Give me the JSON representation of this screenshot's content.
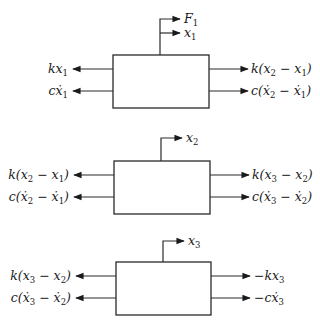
{
  "diagram": {
    "type": "free-body diagrams of three masses (spring-damper system)",
    "colors": {
      "stroke": "#2a2a2a",
      "text": "#1a1a1a",
      "background": "#ffffff"
    },
    "blocks": [
      {
        "id": "mass-1",
        "top_labels": [
          {
            "base": "F",
            "sub": "1",
            "text": "F₁"
          },
          {
            "base": "x",
            "sub": "1",
            "text": "x₁"
          }
        ],
        "left_forces": [
          {
            "text": "kx₁",
            "parts": [
              "kx",
              "1",
              ""
            ]
          },
          {
            "text": "cẋ₁",
            "parts": [
              "cẋ",
              "1",
              ""
            ]
          }
        ],
        "right_forces": [
          {
            "text": "k(x₂ − x₁)",
            "parts": [
              "k(x",
              "2",
              " − x",
              "1",
              ")"
            ]
          },
          {
            "text": "c(ẋ₂ − ẋ₁)",
            "parts": [
              "c(ẋ",
              "2",
              " − ẋ",
              "1",
              ")"
            ]
          }
        ]
      },
      {
        "id": "mass-2",
        "top_labels": [
          {
            "base": "x",
            "sub": "2",
            "text": "x₂"
          }
        ],
        "left_forces": [
          {
            "text": "k(x₂ − x₁)",
            "parts": [
              "k(x",
              "2",
              " − x",
              "1",
              ")"
            ]
          },
          {
            "text": "c(ẋ₂ − ẋ₁)",
            "parts": [
              "c(ẋ",
              "2",
              " − ẋ",
              "1",
              ")"
            ]
          }
        ],
        "right_forces": [
          {
            "text": "k(x₃ − x₂)",
            "parts": [
              "k(x",
              "3",
              " − x",
              "2",
              ")"
            ]
          },
          {
            "text": "c(ẋ₃ − ẋ₂)",
            "parts": [
              "c(ẋ",
              "3",
              " − ẋ",
              "2",
              ")"
            ]
          }
        ]
      },
      {
        "id": "mass-3",
        "top_labels": [
          {
            "base": "x",
            "sub": "3",
            "text": "x₃"
          }
        ],
        "left_forces": [
          {
            "text": "k(x₃ − x₂)",
            "parts": [
              "k(x",
              "3",
              " − x",
              "2",
              ")"
            ]
          },
          {
            "text": "c(ẋ₃ − ẋ₂)",
            "parts": [
              "c(ẋ",
              "3",
              " − ẋ",
              "2",
              ")"
            ]
          }
        ],
        "right_forces": [
          {
            "text": "−kx₃",
            "parts": [
              "−kx",
              "3",
              ""
            ]
          },
          {
            "text": "−cẋ₃",
            "parts": [
              "−cẋ",
              "3",
              ""
            ]
          }
        ]
      }
    ]
  },
  "p": {
    "b1": {
      "F": "F",
      "F_s": "1",
      "x": "x",
      "x_s": "1",
      "l1a": "kx",
      "l1s": "1",
      "l2a": "cẋ",
      "l2s": "1",
      "r1a": "k(x",
      "r1s": "2",
      "r1b": " − x",
      "r1t": "1",
      "r1c": ")",
      "r2a": "c(ẋ",
      "r2s": "2",
      "r2b": " − ẋ",
      "r2t": "1",
      "r2c": ")"
    },
    "b2": {
      "x": "x",
      "x_s": "2",
      "l1a": "k(x",
      "l1s": "2",
      "l1b": " − x",
      "l1t": "1",
      "l1c": ")",
      "l2a": "c(ẋ",
      "l2s": "2",
      "l2b": " − ẋ",
      "l2t": "1",
      "l2c": ")",
      "r1a": "k(x",
      "r1s": "3",
      "r1b": " − x",
      "r1t": "2",
      "r1c": ")",
      "r2a": "c(ẋ",
      "r2s": "3",
      "r2b": " − ẋ",
      "r2t": "2",
      "r2c": ")"
    },
    "b3": {
      "x": "x",
      "x_s": "3",
      "l1a": "k(x",
      "l1s": "3",
      "l1b": " − x",
      "l1t": "2",
      "l1c": ")",
      "l2a": "c(ẋ",
      "l2s": "3",
      "l2b": " − ẋ",
      "l2t": "2",
      "l2c": ")",
      "r1a": "−kx",
      "r1s": "3",
      "r2a": "−cẋ",
      "r2s": "3"
    }
  }
}
